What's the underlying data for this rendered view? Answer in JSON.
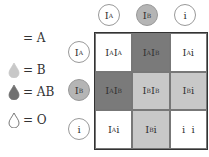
{
  "legend": [
    {
      "symbol": "drop",
      "color": "#ffffff",
      "label": "= A"
    },
    {
      "symbol": "drop",
      "color": "#c8c8c8",
      "label": "= B"
    },
    {
      "symbol": "drop",
      "color": "#707070",
      "label": "= AB"
    },
    {
      "symbol": "drop-outline",
      "color": "#ffffff",
      "label": "= O"
    }
  ],
  "columns": [
    {
      "base": "I",
      "sup": "A",
      "fill": "#ffffff"
    },
    {
      "base": "I",
      "sup": "B",
      "fill": "#b5b5b5"
    },
    {
      "base": "i",
      "sup": "",
      "fill": "#ffffff"
    }
  ],
  "rows": [
    {
      "base": "I",
      "sup": "A",
      "fill": "#ffffff"
    },
    {
      "base": "I",
      "sup": "B",
      "fill": "#b5b5b5"
    },
    {
      "base": "i",
      "sup": "",
      "fill": "#ffffff"
    }
  ],
  "cells": [
    [
      {
        "html": "I<sup>A</sup>I<sup>A</sup>",
        "fill": "#ffffff"
      },
      {
        "html": "I<sup>A</sup>I<sup>B</sup>",
        "fill": "#7a7a7a"
      },
      {
        "html": "I<sup>A</sup> i",
        "fill": "#ffffff"
      }
    ],
    [
      {
        "html": "I<sup>A</sup>I<sup>B</sup>",
        "fill": "#7a7a7a"
      },
      {
        "html": "I<sup>B</sup>I<sup>B</sup>",
        "fill": "#c8c8c8"
      },
      {
        "html": "I<sup>B</sup> i",
        "fill": "#c8c8c8"
      }
    ],
    [
      {
        "html": "I<sup>A</sup> i",
        "fill": "#ffffff"
      },
      {
        "html": "I<sup>B</sup> i",
        "fill": "#c8c8c8"
      },
      {
        "html": "i &nbsp;i",
        "fill": "#ffffff"
      }
    ]
  ]
}
